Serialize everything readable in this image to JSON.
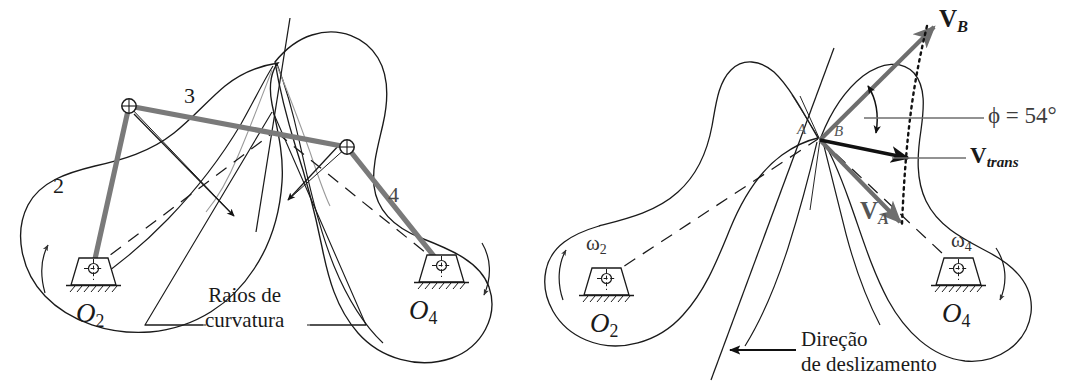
{
  "figure": {
    "type": "engineering-diagram",
    "language": "pt-BR",
    "background_color": "#ffffff",
    "line_color": "#1a1a1a",
    "accent_link_color": "#7a7a7a",
    "vector_gray_color": "#6e6e6e"
  },
  "left_panel": {
    "name": "equivalent-linkage-and-radii-of-curvature",
    "labels": {
      "link2": "2",
      "link3": "3",
      "link4": "4",
      "pivot_left": "O",
      "pivot_left_sub": "2",
      "pivot_right": "O",
      "pivot_right_sub": "4",
      "callout_line1": "Raios de",
      "callout_line2": "curvatura"
    }
  },
  "right_panel": {
    "name": "velocity-of-sliding-diagram",
    "labels": {
      "point_a": "A",
      "point_b": "B",
      "vector_b": "V",
      "vector_b_sub": "B",
      "vector_a": "V",
      "vector_a_sub": "A",
      "vector_trans": "V",
      "vector_trans_sub": "trans",
      "angle_label": "ϕ = 54°",
      "angle_symbol": "ϕ",
      "angle_value": "54",
      "angle_unit": "°",
      "omega2": "ω",
      "omega2_sub": "2",
      "omega4": "ω",
      "omega4_sub": "4",
      "pivot_left": "O",
      "pivot_left_sub": "2",
      "pivot_right": "O",
      "pivot_right_sub": "4",
      "callout_line1": "Direção",
      "callout_line2": "de deslizamento"
    }
  }
}
